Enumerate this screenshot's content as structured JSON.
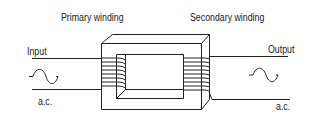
{
  "diagram": {
    "type": "transformer",
    "labels": {
      "primary": "Primary winding",
      "secondary": "Secondary winding",
      "input": "Input",
      "output": "Output",
      "input_ac": "a.c.",
      "output_ac": "a.c."
    },
    "icons": {
      "input_wave": "sine-wave",
      "output_wave": "sine-wave"
    },
    "primary_turns": 8,
    "secondary_turns": 9,
    "stroke_color": "#222222"
  }
}
